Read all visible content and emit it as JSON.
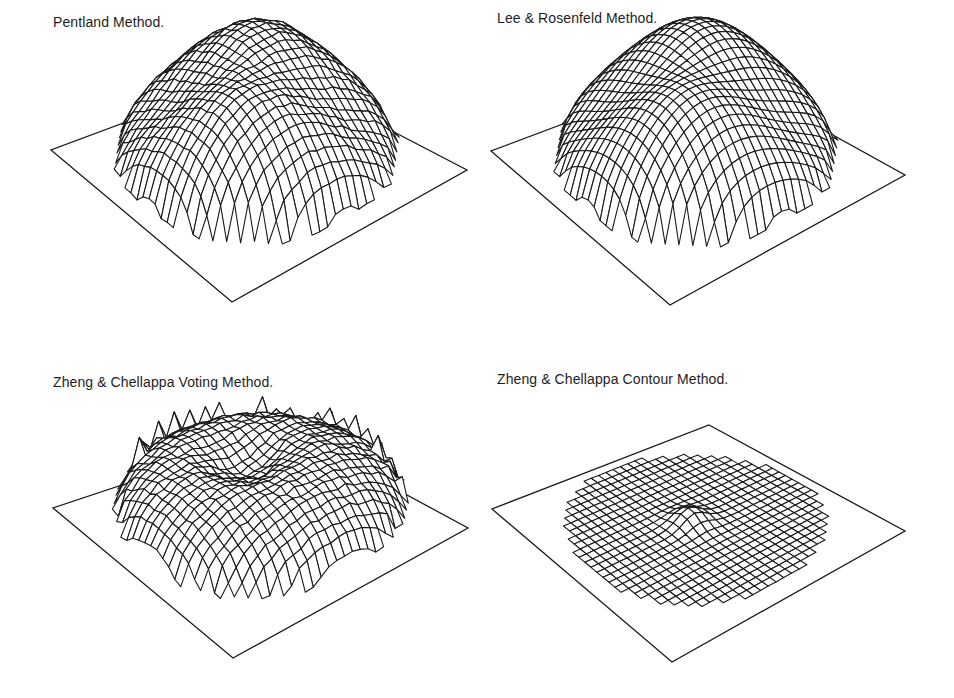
{
  "figure": {
    "background": "#ffffff",
    "line_color": "#1a1a1a",
    "panels": [
      {
        "id": "pentland",
        "title": "Pentland Method.",
        "title_pos": [
          53,
          14
        ],
        "plane": {
          "back": [
            271,
            68
          ],
          "left": [
            51,
            150
          ],
          "front": [
            232,
            302
          ],
          "right": [
            467,
            170
          ]
        },
        "grid": 30,
        "support_radius": 0.47,
        "surface": {
          "type": "ridge",
          "height": 118,
          "lift": 14,
          "fold": 0.55,
          "noise": 3
        }
      },
      {
        "id": "lee-rosenfeld",
        "title": "Lee & Rosenfeld Method.",
        "title_pos": [
          497,
          10
        ],
        "plane": {
          "back": [
            712,
            68
          ],
          "left": [
            491,
            151
          ],
          "front": [
            670,
            305
          ],
          "right": [
            905,
            175
          ]
        },
        "grid": 30,
        "support_radius": 0.47,
        "surface": {
          "type": "ridge",
          "height": 122,
          "lift": 14,
          "fold": 0.6,
          "noise": 0
        }
      },
      {
        "id": "zheng-chellappa-voting",
        "title": "Zheng & Chellappa Voting Method.",
        "title_pos": [
          53,
          374
        ],
        "plane": {
          "back": [
            287,
            430
          ],
          "left": [
            53,
            508
          ],
          "front": [
            233,
            658
          ],
          "right": [
            468,
            528
          ]
        },
        "grid": 30,
        "support_radius": 0.48,
        "surface": {
          "type": "dome-spiky",
          "height": 88,
          "lift": 10,
          "fold": 0.35,
          "noise": 4
        }
      },
      {
        "id": "zheng-chellappa-contour",
        "title": "Zheng & Chellappa Contour Method.",
        "title_pos": [
          497,
          371
        ],
        "plane": {
          "back": [
            709,
            425
          ],
          "left": [
            492,
            509
          ],
          "front": [
            672,
            662
          ],
          "right": [
            905,
            531
          ]
        },
        "grid": 30,
        "support_radius": 0.44,
        "surface": {
          "type": "flat-bump",
          "height": 14,
          "lift": 6,
          "fold": 0,
          "noise": 0
        }
      }
    ]
  }
}
